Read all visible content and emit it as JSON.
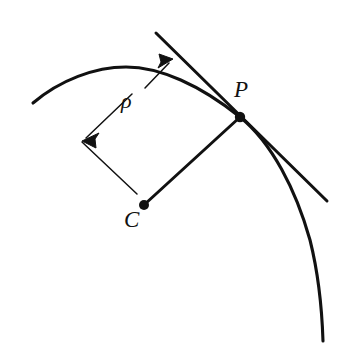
{
  "figure": {
    "background_color": "#ffffff",
    "stroke_color": "#111111",
    "width": 350,
    "height": 343,
    "labels": {
      "point_p": "P",
      "center_c": "C",
      "radius_symbol": "ρ"
    },
    "geometry": {
      "point_p": {
        "x": 240,
        "y": 117
      },
      "point_c": {
        "x": 144,
        "y": 205
      },
      "curve_start": {
        "x": 33,
        "y": 103
      },
      "curve_apex": {
        "x": 126,
        "y": 67
      },
      "curve_end": {
        "x": 323,
        "y": 341
      },
      "tangent_start": {
        "x": 156,
        "y": 33
      },
      "tangent_end": {
        "x": 327,
        "y": 201
      },
      "dimension_corner": {
        "x": 82,
        "y": 141
      },
      "dimension_arrow_upper_tip": {
        "x": 173,
        "y": 59
      },
      "dimension_leader_lower": {
        "x": 145,
        "y": 88
      },
      "extension_line_end": {
        "x": 137,
        "y": 194
      }
    },
    "elements": {
      "curve_name": "plane-curve",
      "tangent_name": "tangent-line",
      "radius_name": "radius-line-cp",
      "dimension_name": "rho-dimension-arrows"
    }
  }
}
